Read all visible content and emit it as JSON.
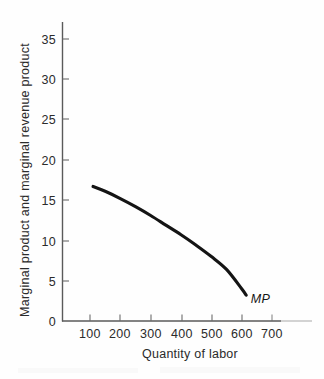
{
  "chart_data": {
    "type": "line",
    "title": "",
    "xlabel": "Quantity of labor",
    "ylabel": "Marginal product and marginal revenue product",
    "xlim": [
      0,
      780
    ],
    "ylim": [
      0,
      37
    ],
    "grid": false,
    "legend_position": "inline-curve-end",
    "xticks": [
      100,
      200,
      300,
      400,
      500,
      600,
      700
    ],
    "xtick_labels": [
      "100",
      "200",
      "300",
      "400",
      "500",
      "600",
      "700"
    ],
    "yticks": [
      0,
      5,
      10,
      15,
      20,
      25,
      30,
      35
    ],
    "ytick_labels": [
      "0",
      "5",
      "10",
      "15",
      "20",
      "25",
      "30",
      "35"
    ],
    "series": [
      {
        "name": "MP",
        "label": "MP",
        "color": "#141414",
        "x": [
          110,
          150,
          200,
          250,
          300,
          350,
          400,
          450,
          500,
          550,
          600,
          615
        ],
        "values": [
          16.7,
          16.1,
          15.2,
          14.2,
          13.1,
          11.9,
          10.7,
          9.4,
          8.0,
          6.4,
          4.0,
          3.2
        ]
      }
    ],
    "annotations": [
      {
        "text": "MP",
        "x": 630,
        "y": 2.2,
        "style": "italic"
      }
    ]
  },
  "axis": {
    "x_title": "Quantity of labor",
    "y_title": "Marginal product and marginal revenue product"
  }
}
